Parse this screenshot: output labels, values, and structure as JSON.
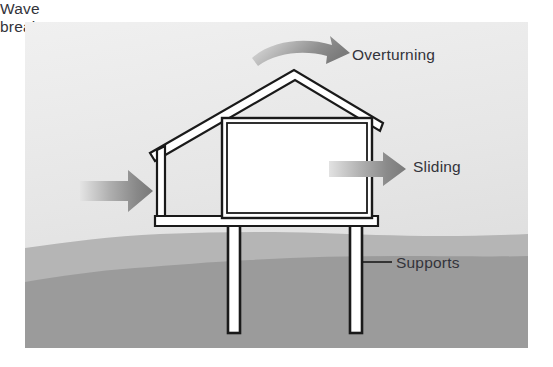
{
  "figure": {
    "canvas": {
      "width": 553,
      "height": 367,
      "background": "#ffffff"
    },
    "panel": {
      "x": 25,
      "y": 22,
      "width": 503,
      "height": 326,
      "sky_color_top": "#eeeeee",
      "sky_color_bottom": "#dedede"
    }
  },
  "labels": {
    "overturning": "Overturning",
    "sliding": "Sliding",
    "supports": "Supports",
    "wave_break_line1": "Wave",
    "wave_break_line2": "break"
  },
  "colors": {
    "text": "#33333a",
    "outline": "#1a1a1a",
    "structure_fill": "#ffffff",
    "arrow_dark": "#7d7d7d",
    "arrow_light": "#d8d8d8",
    "ground_upper": "#b3b3b3",
    "ground_lower": "#9a9a9a",
    "leader_line": "#1a1a1a"
  },
  "arrows": [
    {
      "name": "overturning-arrow",
      "kind": "curved",
      "direction": "clockwise-right",
      "label": "Overturning",
      "from": [
        254,
        52
      ],
      "to": [
        346,
        60
      ]
    },
    {
      "name": "sliding-arrow",
      "kind": "straight",
      "direction": "right",
      "label": "Sliding",
      "from": [
        330,
        168
      ],
      "to": [
        405,
        168
      ]
    },
    {
      "name": "wave-break-arrow",
      "kind": "straight",
      "direction": "right",
      "label": "Wave break",
      "from": [
        80,
        190
      ],
      "to": [
        152,
        190
      ]
    }
  ],
  "structure": {
    "name": "elevated-house-cross-section",
    "parts": [
      "gable-roof",
      "left-exterior-wall",
      "interior-room-box",
      "floor-deck",
      "left-support-post",
      "right-support-post"
    ],
    "roof_apex_x": 295,
    "roof_apex_y": 74,
    "left_eave": [
      152,
      148
    ],
    "right_eave": [
      381,
      124
    ],
    "floor_y": 218,
    "post_bottom_y": 333,
    "left_post_x": 228,
    "right_post_x": 350
  },
  "ground": {
    "name": "shoreline-ground-layers",
    "upper_layer_label": "beach-surface",
    "lower_layer_label": "subsurface-soil",
    "upper_layer_top_y": 236,
    "lower_layer_top_y": 262
  },
  "leader_lines": [
    {
      "name": "supports-leader",
      "from": [
        362,
        262
      ],
      "to": [
        392,
        262
      ]
    }
  ]
}
